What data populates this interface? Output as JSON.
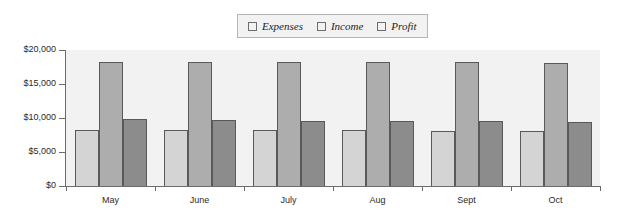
{
  "chart_data": {
    "type": "bar",
    "title": "",
    "xlabel": "",
    "ylabel": "",
    "categories": [
      "May",
      "June",
      "July",
      "Aug",
      "Sept",
      "Oct"
    ],
    "series": [
      {
        "name": "Expenses",
        "color": "#d4d4d4",
        "values": [
          8200,
          8200,
          8200,
          8200,
          8150,
          8100
        ]
      },
      {
        "name": "Income",
        "color": "#adadad",
        "values": [
          18300,
          18300,
          18300,
          18200,
          18200,
          18100
        ]
      },
      {
        "name": "Profit",
        "color": "#8c8c8c",
        "values": [
          9800,
          9700,
          9600,
          9550,
          9500,
          9450
        ]
      }
    ],
    "ylim": [
      0,
      20000
    ],
    "ytick_values": [
      0,
      5000,
      10000,
      15000,
      20000
    ],
    "ytick_labels": [
      "$0",
      "$5,000",
      "$10,000",
      "$15,000",
      "$20,000"
    ],
    "grid": false,
    "legend_position": "top-center"
  },
  "legend": {
    "entries": [
      {
        "label": "Expenses"
      },
      {
        "label": "Income"
      },
      {
        "label": "Profit"
      }
    ]
  }
}
